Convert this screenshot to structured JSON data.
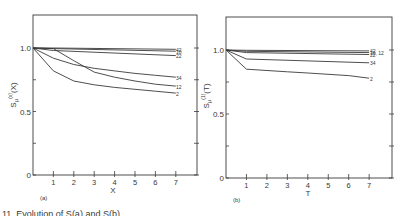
{
  "figure": {
    "caption": "11. Evolution of S(a) and S(b) ..."
  },
  "chart_data": [
    {
      "type": "line",
      "panel": "(a)",
      "title": "",
      "xlabel": "X",
      "ylabel": "Sμ(x)(X)",
      "ylabel_parts": {
        "base": "S",
        "sub": "μ",
        "sup": "(x)",
        "arg": "(X)"
      },
      "xlim": [
        0,
        7.9
      ],
      "ylim": [
        0,
        1.26
      ],
      "x_ticks": [
        1,
        2,
        3,
        4,
        5,
        6,
        7
      ],
      "y_ticks": [
        0,
        0.25,
        0.5,
        0.75,
        1.0
      ],
      "y_tick_labels": {
        "0": "0",
        "0.5": "0.5",
        "1": "1.0"
      },
      "grid": false,
      "legend": "inline labels at right end of curves",
      "series": [
        {
          "name": "42",
          "x": [
            0,
            1,
            7
          ],
          "values": [
            1.0,
            1.0,
            0.99
          ]
        },
        {
          "name": "10",
          "x": [
            0,
            1,
            7
          ],
          "values": [
            1.0,
            0.995,
            0.975
          ]
        },
        {
          "name": "22",
          "x": [
            0,
            1,
            7
          ],
          "values": [
            1.0,
            0.98,
            0.94
          ]
        },
        {
          "name": "34",
          "x": [
            0,
            1,
            2,
            3,
            4,
            5,
            6,
            7
          ],
          "values": [
            1.0,
            0.92,
            0.87,
            0.84,
            0.82,
            0.8,
            0.785,
            0.77
          ]
        },
        {
          "name": "12",
          "x": [
            0,
            1,
            2,
            3,
            4,
            5,
            6,
            7
          ],
          "values": [
            1.0,
            0.995,
            0.9,
            0.81,
            0.77,
            0.74,
            0.715,
            0.7
          ]
        },
        {
          "name": "2",
          "x": [
            0,
            1,
            2,
            3,
            4,
            5,
            6,
            7
          ],
          "values": [
            1.0,
            0.82,
            0.74,
            0.71,
            0.69,
            0.675,
            0.66,
            0.645
          ]
        }
      ]
    },
    {
      "type": "line",
      "panel": "(b)",
      "title": "",
      "xlabel": "T",
      "ylabel": "Sμ(1)(T)",
      "ylabel_parts": {
        "base": "S",
        "sub": "μ",
        "sup": "(1)",
        "arg": "(T)"
      },
      "xlim": [
        0,
        8.1
      ],
      "ylim": [
        0,
        1.26
      ],
      "x_ticks": [
        1,
        2,
        3,
        4,
        5,
        6,
        7
      ],
      "y_ticks": [
        0,
        0.25,
        0.5,
        0.75,
        1.0
      ],
      "y_tick_labels": {
        "0": "0",
        "0.5": "0.5",
        "1": "1.0"
      },
      "grid": false,
      "legend": "inline labels at right end of curves",
      "series": [
        {
          "name": "42",
          "x": [
            0,
            1,
            7
          ],
          "values": [
            1.0,
            0.998,
            0.993
          ]
        },
        {
          "name": "10, 12",
          "x": [
            0,
            1,
            7
          ],
          "values": [
            1.0,
            0.99,
            0.98
          ]
        },
        {
          "name": "22",
          "x": [
            0,
            1,
            7
          ],
          "values": [
            1.0,
            0.98,
            0.965
          ]
        },
        {
          "name": "34",
          "x": [
            0,
            1,
            7
          ],
          "values": [
            1.0,
            0.93,
            0.9
          ]
        },
        {
          "name": "2",
          "x": [
            0,
            1,
            3,
            4,
            6,
            7
          ],
          "values": [
            1.0,
            0.85,
            0.83,
            0.82,
            0.8,
            0.78
          ]
        }
      ]
    }
  ]
}
